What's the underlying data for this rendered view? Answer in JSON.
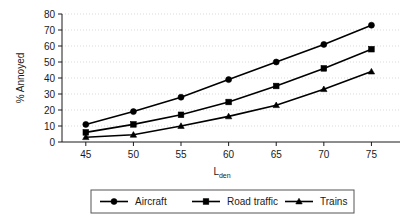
{
  "chart_data": {
    "type": "line",
    "title": "",
    "xlabel": "L_den",
    "xlabel_main": "L",
    "xlabel_sub": "den",
    "ylabel": "% Annoyed",
    "x": [
      45,
      50,
      55,
      60,
      65,
      70,
      75
    ],
    "xticks": [
      "45",
      "50",
      "55",
      "60",
      "65",
      "70",
      "75"
    ],
    "yticks": [
      "0",
      "10",
      "20",
      "30",
      "40",
      "50",
      "60",
      "70",
      "80"
    ],
    "xlim": [
      42.5,
      78
    ],
    "ylim": [
      0,
      80
    ],
    "grid": true,
    "grid_axis": "y",
    "legend_position": "below",
    "series": [
      {
        "name": "Aircraft",
        "marker": "circle",
        "color": "#000000",
        "values": [
          11,
          19,
          28,
          39,
          50,
          61,
          73
        ]
      },
      {
        "name": "Road traffic",
        "marker": "square",
        "color": "#000000",
        "values": [
          6,
          11,
          17,
          25,
          35,
          46,
          58
        ]
      },
      {
        "name": "Trains",
        "marker": "triangle",
        "color": "#000000",
        "values": [
          3,
          4.5,
          10,
          16,
          23,
          33,
          44
        ]
      }
    ]
  },
  "legend": {
    "items": [
      {
        "label": "Aircraft",
        "marker": "circle"
      },
      {
        "label": "Road traffic",
        "marker": "square"
      },
      {
        "label": "Trains",
        "marker": "triangle"
      }
    ]
  }
}
